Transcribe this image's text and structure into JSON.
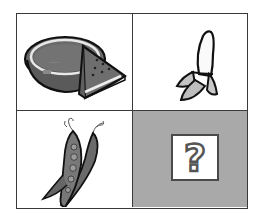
{
  "puzzle": {
    "layout": "2x2 grid",
    "cells": [
      {
        "position": "top-left",
        "item": "watermelon",
        "icon": "watermelon-icon"
      },
      {
        "position": "top-right",
        "item": "banana",
        "icon": "banana-icon"
      },
      {
        "position": "bottom-left",
        "item": "pea pods",
        "icon": "pea-pod-icon"
      },
      {
        "position": "bottom-right",
        "item": "unknown",
        "icon": "question-mark-icon",
        "label": "?"
      }
    ],
    "colors": {
      "grid_line": "#3a3a3a",
      "cell_background": "#ffffff",
      "unknown_cell_background": "#a9a9a9",
      "question_box_border": "#4a4a4a"
    }
  }
}
